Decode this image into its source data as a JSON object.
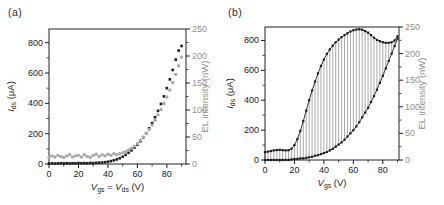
{
  "figure": {
    "background": "#ffffff"
  },
  "chart_data": [
    {
      "panel_label": "(a)",
      "type": "scatter",
      "x_axis": {
        "label_segments": [
          [
            "V",
            "i"
          ],
          [
            "gs",
            "sub"
          ],
          [
            " = ",
            "n"
          ],
          [
            "V",
            "i"
          ],
          [
            "ds",
            "sub"
          ],
          [
            " (V)",
            "n"
          ]
        ],
        "ticks": [
          0,
          20,
          40,
          60,
          80
        ],
        "minor_ticks": [
          10,
          30,
          50,
          70,
          90
        ],
        "range": [
          0,
          93
        ]
      },
      "y_left": {
        "label_segments": [
          [
            "I",
            "i"
          ],
          [
            "ds",
            "sub"
          ],
          [
            " (μA)",
            "n"
          ]
        ],
        "ticks": [
          0,
          200,
          400,
          600,
          800
        ],
        "minor_ticks": [
          100,
          300,
          500,
          700
        ],
        "range": [
          0,
          890
        ],
        "color": "#1c1c1c"
      },
      "y_right": {
        "label_segments": [
          [
            "EL intensity (nW)",
            "n"
          ]
        ],
        "ticks": [
          0,
          50,
          100,
          150,
          200,
          250
        ],
        "minor_ticks": [
          25,
          75,
          125,
          175,
          225
        ],
        "range": [
          0,
          250
        ],
        "color": "#8f8f8f"
      },
      "x_values": [
        0,
        2,
        4,
        6,
        8,
        10,
        12,
        14,
        16,
        18,
        20,
        22,
        24,
        26,
        28,
        30,
        32,
        34,
        36,
        38,
        40,
        42,
        44,
        46,
        48,
        50,
        52,
        54,
        56,
        58,
        60,
        62,
        64,
        66,
        68,
        70,
        72,
        74,
        76,
        78,
        80,
        82,
        84,
        86,
        88,
        90
      ],
      "series": [
        {
          "name": "Ids",
          "axis": "left",
          "marker": "square",
          "color": "#1c1c1c",
          "line": false,
          "values": [
            3,
            4,
            3,
            4,
            5,
            4,
            5,
            4,
            5,
            4,
            6,
            5,
            6,
            5,
            7,
            6,
            8,
            9,
            10,
            12,
            15,
            19,
            24,
            30,
            38,
            48,
            60,
            74,
            90,
            108,
            128,
            150,
            175,
            203,
            235,
            270,
            308,
            350,
            396,
            446,
            500,
            558,
            620,
            688,
            748,
            778
          ]
        },
        {
          "name": "EL",
          "axis": "right",
          "marker": "circle",
          "color": "#a8a8a8",
          "line": false,
          "values": [
            12,
            15,
            13,
            16,
            14,
            12,
            15,
            17,
            13,
            15,
            16,
            13,
            17,
            14,
            12,
            16,
            18,
            14,
            17,
            15,
            18,
            16,
            19,
            17,
            19,
            21,
            23,
            26,
            29,
            33,
            38,
            44,
            50,
            57,
            64,
            72,
            81,
            91,
            101,
            112,
            124,
            137,
            151,
            166,
            182,
            198
          ]
        }
      ],
      "hatch": null
    },
    {
      "panel_label": "(b)",
      "type": "line",
      "x_axis": {
        "label_segments": [
          [
            "V",
            "i"
          ],
          [
            "gs",
            "sub"
          ],
          [
            " (V)",
            "n"
          ]
        ],
        "ticks": [
          0,
          20,
          40,
          60,
          80
        ],
        "minor_ticks": [
          10,
          30,
          50,
          70,
          90
        ],
        "range": [
          0,
          91
        ]
      },
      "y_left": {
        "label_segments": [
          [
            "I",
            "i"
          ],
          [
            "ds",
            "sub"
          ],
          [
            " (μA)",
            "n"
          ]
        ],
        "ticks": [
          0,
          200,
          400,
          600,
          800
        ],
        "minor_ticks": [
          100,
          300,
          500,
          700
        ],
        "range": [
          0,
          890
        ],
        "color": "#1c1c1c"
      },
      "y_right": {
        "label_segments": [
          [
            "EL intensity (nW)",
            "n"
          ]
        ],
        "ticks": [
          0,
          50,
          100,
          150,
          200,
          250
        ],
        "minor_ticks": [
          25,
          75,
          125,
          175,
          225
        ],
        "range": [
          0,
          250
        ],
        "color": "#8f8f8f"
      },
      "x_values": [
        0,
        2,
        4,
        6,
        8,
        10,
        12,
        14,
        16,
        18,
        20,
        22,
        24,
        26,
        28,
        30,
        32,
        34,
        36,
        38,
        40,
        42,
        44,
        46,
        48,
        50,
        52,
        54,
        56,
        58,
        60,
        62,
        64,
        66,
        68,
        70,
        72,
        74,
        76,
        78,
        80,
        82,
        84,
        86,
        88,
        90
      ],
      "series": [
        {
          "name": "Ids",
          "axis": "left",
          "marker": "square",
          "color": "#1c1c1c",
          "line": true,
          "values": [
            52,
            56,
            60,
            64,
            67,
            68,
            66,
            64,
            66,
            76,
            100,
            140,
            195,
            260,
            330,
            400,
            465,
            525,
            580,
            630,
            672,
            710,
            740,
            765,
            788,
            806,
            822,
            836,
            848,
            860,
            868,
            873,
            875,
            872,
            863,
            852,
            836,
            818,
            804,
            795,
            788,
            784,
            784,
            788,
            800,
            828
          ]
        },
        {
          "name": "EL",
          "axis": "right",
          "marker": "square",
          "color": "#1c1c1c",
          "line": true,
          "values": [
            0,
            0,
            0,
            0,
            0,
            0,
            0,
            0,
            0,
            1,
            2,
            2,
            3,
            3,
            4,
            5,
            6,
            8,
            9,
            11,
            13,
            15,
            18,
            21,
            25,
            29,
            33,
            38,
            44,
            50,
            56,
            63,
            71,
            80,
            89,
            98,
            109,
            120,
            132,
            145,
            158,
            172,
            186,
            200,
            214,
            228
          ]
        }
      ],
      "hatch": {
        "between": [
          0,
          1
        ],
        "color": "#3f3f3f",
        "width": 0.45
      }
    }
  ]
}
